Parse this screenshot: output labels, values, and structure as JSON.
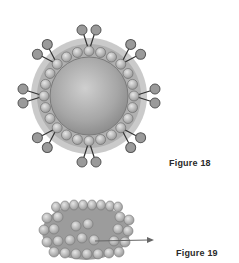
{
  "figures": [
    {
      "id": "figure-18",
      "caption": "Figure 18",
      "subject": "spherical particle with surface subunits and projecting spikes"
    },
    {
      "id": "figure-19",
      "caption": "Figure 19",
      "subject": "barrel-shaped particle composed of spherical subunits with arrow"
    }
  ],
  "colors": {
    "background": "#ffffff",
    "core": "#a8a8a8",
    "subunit": "#bdbdbd",
    "outline": "#4a4a4a",
    "arrow": "#6a6a6a"
  }
}
